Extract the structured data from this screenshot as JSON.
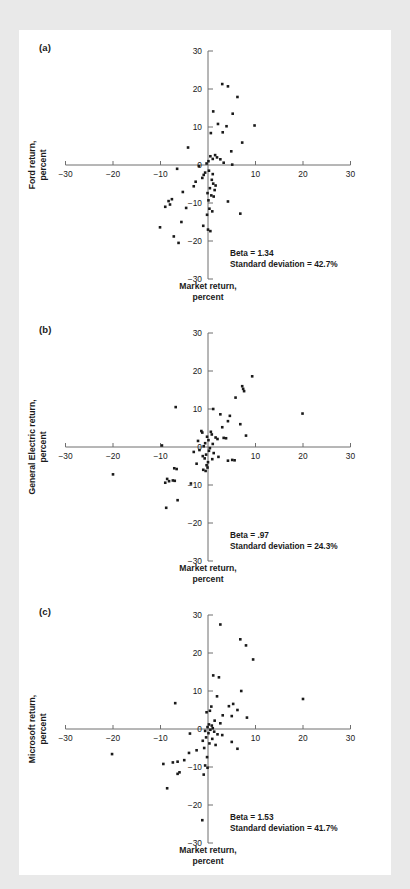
{
  "figure": {
    "background_color": "#e9e9e9",
    "card_color": "#ffffff",
    "axis_color": "#6f6f6f",
    "point_color": "#1a1a1a",
    "xlabel": "Market return,\npercent"
  },
  "panels": [
    {
      "tag": "(a)",
      "ylabel": "Ford return,\npercent",
      "beta_label": "Beta = 1.34",
      "sd_label": "Standard deviation = 42.7%"
    },
    {
      "tag": "(b)",
      "ylabel": "General Electric return,\npercent",
      "beta_label": "Beta = .97",
      "sd_label": "Standard deviation = 24.3%"
    },
    {
      "tag": "(c)",
      "ylabel": "Microsoft return,\npercent",
      "beta_label": "Beta = 1.53",
      "sd_label": "Standard deviation = 41.7%"
    }
  ],
  "chart_data": [
    {
      "type": "scatter",
      "title": "(a) Ford",
      "xlabel": "Market return, percent",
      "ylabel": "Ford return, percent",
      "xlim": [
        -30,
        30
      ],
      "ylim": [
        -30,
        30
      ],
      "xticks": [
        -30,
        -20,
        -10,
        0,
        10,
        20,
        30
      ],
      "yticks": [
        -30,
        -20,
        -10,
        0,
        10,
        20,
        30
      ],
      "grid": false,
      "legend": "none",
      "annotations": [
        "Beta = 1.34",
        "Standard deviation = 42.7%"
      ],
      "points": [
        [
          3.0,
          21.3
        ],
        [
          4.2,
          20.7
        ],
        [
          6.2,
          17.9
        ],
        [
          5.2,
          13.5
        ],
        [
          1.1,
          14.1
        ],
        [
          2.1,
          10.8
        ],
        [
          3.9,
          10.2
        ],
        [
          9.8,
          10.4
        ],
        [
          3.1,
          8.6
        ],
        [
          0.6,
          8.4
        ],
        [
          7.2,
          5.9
        ],
        [
          -4.2,
          4.6
        ],
        [
          4.9,
          3.6
        ],
        [
          1.5,
          2.6
        ],
        [
          0.5,
          2.3
        ],
        [
          1.9,
          2.0
        ],
        [
          1.0,
          1.6
        ],
        [
          2.6,
          1.5
        ],
        [
          0.1,
          1.0
        ],
        [
          3.3,
          0.6
        ],
        [
          -0.3,
          0.4
        ],
        [
          5.1,
          0.1
        ],
        [
          -1.9,
          -0.3
        ],
        [
          -6.5,
          -1.0
        ],
        [
          0.2,
          -1.5
        ],
        [
          -0.6,
          -2.0
        ],
        [
          -0.9,
          -2.6
        ],
        [
          1.0,
          -2.4
        ],
        [
          -1.2,
          -3.4
        ],
        [
          0.8,
          -3.9
        ],
        [
          -2.6,
          -4.4
        ],
        [
          1.1,
          -4.9
        ],
        [
          -3.0,
          -5.6
        ],
        [
          1.6,
          -5.4
        ],
        [
          0.4,
          -6.1
        ],
        [
          1.4,
          -6.6
        ],
        [
          -5.3,
          -7.1
        ],
        [
          -0.1,
          -7.4
        ],
        [
          0.7,
          -8.0
        ],
        [
          1.2,
          -8.3
        ],
        [
          -7.6,
          -9.0
        ],
        [
          -8.3,
          -9.5
        ],
        [
          0.1,
          -9.3
        ],
        [
          -8.0,
          -10.4
        ],
        [
          4.2,
          -9.6
        ],
        [
          -9.0,
          -11.0
        ],
        [
          -4.6,
          -11.3
        ],
        [
          0.3,
          -11.5
        ],
        [
          0.9,
          -12.2
        ],
        [
          6.8,
          -12.8
        ],
        [
          -0.2,
          -13.1
        ],
        [
          -5.6,
          -15.0
        ],
        [
          -1.0,
          -16.0
        ],
        [
          -10.1,
          -16.4
        ],
        [
          0.0,
          -17.0
        ],
        [
          0.5,
          -17.4
        ],
        [
          -7.2,
          -18.8
        ],
        [
          -6.2,
          -20.5
        ]
      ]
    },
    {
      "type": "scatter",
      "title": "(b) General Electric",
      "xlabel": "Market return, percent",
      "ylabel": "General Electric return, percent",
      "xlim": [
        -30,
        30
      ],
      "ylim": [
        -30,
        30
      ],
      "xticks": [
        -30,
        -20,
        -10,
        0,
        10,
        20,
        30
      ],
      "yticks": [
        -30,
        -20,
        -10,
        0,
        10,
        20,
        30
      ],
      "grid": false,
      "legend": "none",
      "annotations": [
        "Beta = .97",
        "Standard deviation = 24.3%"
      ],
      "points": [
        [
          9.3,
          18.6
        ],
        [
          7.2,
          16.0
        ],
        [
          7.4,
          15.3
        ],
        [
          7.6,
          14.7
        ],
        [
          5.8,
          13.0
        ],
        [
          -6.8,
          10.5
        ],
        [
          1.1,
          10.0
        ],
        [
          19.9,
          8.8
        ],
        [
          2.6,
          8.6
        ],
        [
          4.6,
          8.2
        ],
        [
          4.2,
          6.8
        ],
        [
          6.8,
          6.0
        ],
        [
          3.0,
          5.2
        ],
        [
          8.0,
          3.0
        ],
        [
          -1.4,
          4.2
        ],
        [
          -1.2,
          3.8
        ],
        [
          0.6,
          4.0
        ],
        [
          0.8,
          3.3
        ],
        [
          -0.2,
          2.7
        ],
        [
          1.6,
          2.5
        ],
        [
          2.0,
          2.1
        ],
        [
          3.3,
          2.4
        ],
        [
          3.8,
          2.3
        ],
        [
          -2.1,
          1.6
        ],
        [
          0.1,
          1.8
        ],
        [
          -0.6,
          1.0
        ],
        [
          1.0,
          0.8
        ],
        [
          -9.7,
          0.4
        ],
        [
          -0.9,
          0.2
        ],
        [
          0.4,
          -0.3
        ],
        [
          -1.8,
          -0.8
        ],
        [
          -3.0,
          -1.3
        ],
        [
          0.2,
          -1.0
        ],
        [
          1.2,
          -1.6
        ],
        [
          -0.4,
          -2.0
        ],
        [
          -1.1,
          -2.4
        ],
        [
          2.2,
          -2.6
        ],
        [
          -0.7,
          -3.0
        ],
        [
          0.9,
          -3.2
        ],
        [
          4.2,
          -3.6
        ],
        [
          5.1,
          -3.4
        ],
        [
          5.6,
          -3.5
        ],
        [
          0.0,
          -4.0
        ],
        [
          -2.4,
          -4.4
        ],
        [
          -0.3,
          -4.8
        ],
        [
          -0.1,
          -5.4
        ],
        [
          -7.1,
          -5.6
        ],
        [
          -6.6,
          -5.8
        ],
        [
          -1.0,
          -6.0
        ],
        [
          -0.5,
          -6.3
        ],
        [
          -20.0,
          -7.2
        ],
        [
          -8.6,
          -8.4
        ],
        [
          -8.2,
          -9.0
        ],
        [
          -7.4,
          -8.8
        ],
        [
          -7.0,
          -8.9
        ],
        [
          -9.0,
          -9.4
        ],
        [
          -3.6,
          -9.6
        ],
        [
          -6.4,
          -14.0
        ],
        [
          -8.8,
          -16.0
        ]
      ]
    },
    {
      "type": "scatter",
      "title": "(c) Microsoft",
      "xlabel": "Market return, percent",
      "ylabel": "Microsoft return, percent",
      "xlim": [
        -30,
        30
      ],
      "ylim": [
        -30,
        30
      ],
      "xticks": [
        -30,
        -20,
        -10,
        0,
        10,
        20,
        30
      ],
      "yticks": [
        -30,
        -20,
        -10,
        0,
        10,
        20,
        30
      ],
      "grid": false,
      "legend": "none",
      "annotations": [
        "Beta = 1.53",
        "Standard deviation = 41.7%"
      ],
      "points": [
        [
          2.6,
          27.5
        ],
        [
          6.8,
          23.6
        ],
        [
          8.0,
          22.0
        ],
        [
          9.5,
          18.3
        ],
        [
          1.1,
          14.1
        ],
        [
          2.3,
          13.6
        ],
        [
          7.0,
          10.0
        ],
        [
          20.0,
          7.9
        ],
        [
          1.9,
          8.6
        ],
        [
          -6.9,
          6.8
        ],
        [
          0.7,
          5.9
        ],
        [
          4.4,
          6.0
        ],
        [
          5.3,
          6.6
        ],
        [
          6.2,
          5.0
        ],
        [
          0.4,
          4.8
        ],
        [
          -0.3,
          4.4
        ],
        [
          3.1,
          3.6
        ],
        [
          5.0,
          3.4
        ],
        [
          8.2,
          3.0
        ],
        [
          1.4,
          2.2
        ],
        [
          2.6,
          1.5
        ],
        [
          0.2,
          1.2
        ],
        [
          0.8,
          0.9
        ],
        [
          -0.1,
          0.5
        ],
        [
          1.0,
          0.2
        ],
        [
          0.5,
          -0.2
        ],
        [
          -0.6,
          -0.5
        ],
        [
          1.3,
          -0.7
        ],
        [
          0.1,
          -1.1
        ],
        [
          -3.8,
          -1.2
        ],
        [
          2.0,
          -1.4
        ],
        [
          3.0,
          -1.6
        ],
        [
          -0.4,
          -2.2
        ],
        [
          0.9,
          -2.6
        ],
        [
          -1.1,
          -3.1
        ],
        [
          5.0,
          -3.4
        ],
        [
          0.3,
          -3.8
        ],
        [
          1.6,
          -4.2
        ],
        [
          6.2,
          -5.2
        ],
        [
          -0.8,
          -5.0
        ],
        [
          -2.4,
          -5.6
        ],
        [
          -4.0,
          -6.3
        ],
        [
          -20.2,
          -6.6
        ],
        [
          -0.2,
          -7.4
        ],
        [
          -5.0,
          -8.2
        ],
        [
          -6.4,
          -8.6
        ],
        [
          -7.4,
          -8.8
        ],
        [
          -9.4,
          -9.2
        ],
        [
          -0.6,
          -9.6
        ],
        [
          -0.1,
          -10.2
        ],
        [
          -6.0,
          -11.4
        ],
        [
          -6.4,
          -11.8
        ],
        [
          -0.9,
          -12.0
        ],
        [
          -8.6,
          -15.6
        ],
        [
          -1.2,
          -24.0
        ]
      ]
    }
  ]
}
